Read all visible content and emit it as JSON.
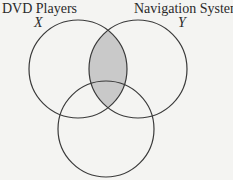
{
  "diagram": {
    "type": "venn",
    "sets": [
      {
        "id": "X",
        "title": "DVD Players",
        "variable": "X"
      },
      {
        "id": "Y",
        "title": "Navigation System",
        "variable": "Y"
      },
      {
        "id": "Z",
        "title": "",
        "variable": ""
      }
    ],
    "shaded_region": "X ∩ Y",
    "colors": {
      "stroke": "#3a3a3a",
      "shade": "#c9c9c9",
      "background": "#f4f4f2"
    }
  }
}
